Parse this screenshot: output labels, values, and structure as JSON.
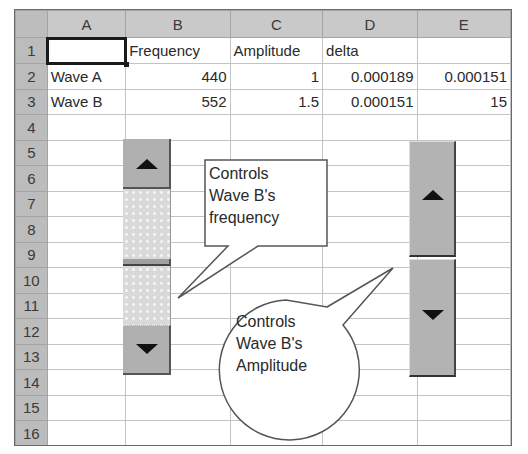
{
  "spreadsheet": {
    "columns": [
      "A",
      "B",
      "C",
      "D",
      "E"
    ],
    "rows": [
      {
        "n": "1",
        "cells": [
          "",
          "Frequency",
          "Amplitude",
          "delta",
          ""
        ]
      },
      {
        "n": "2",
        "cells": [
          "Wave A",
          "440",
          "1",
          "0.000189",
          "0.000151"
        ]
      },
      {
        "n": "3",
        "cells": [
          "Wave B",
          "552",
          "1.5",
          "0.000151",
          "15"
        ]
      },
      {
        "n": "4",
        "cells": [
          "",
          "",
          "",
          "",
          ""
        ]
      },
      {
        "n": "5",
        "cells": [
          "",
          "",
          "",
          "",
          ""
        ]
      },
      {
        "n": "6",
        "cells": [
          "",
          "",
          "",
          "",
          ""
        ]
      },
      {
        "n": "7",
        "cells": [
          "",
          "",
          "",
          "",
          ""
        ]
      },
      {
        "n": "8",
        "cells": [
          "",
          "",
          "",
          "",
          ""
        ]
      },
      {
        "n": "9",
        "cells": [
          "",
          "",
          "",
          "",
          ""
        ]
      },
      {
        "n": "10",
        "cells": [
          "",
          "",
          "",
          "",
          ""
        ]
      },
      {
        "n": "11",
        "cells": [
          "",
          "",
          "",
          "",
          ""
        ]
      },
      {
        "n": "12",
        "cells": [
          "",
          "",
          "",
          "",
          ""
        ]
      },
      {
        "n": "13",
        "cells": [
          "",
          "",
          "",
          "",
          ""
        ]
      },
      {
        "n": "14",
        "cells": [
          "",
          "",
          "",
          "",
          ""
        ]
      },
      {
        "n": "15",
        "cells": [
          "",
          "",
          "",
          "",
          ""
        ]
      },
      {
        "n": "16",
        "cells": [
          "",
          "",
          "",
          "",
          ""
        ]
      }
    ],
    "selected_cell": "A1"
  },
  "controls": {
    "scrollbar": {
      "name": "Wave B frequency scrollbar",
      "up_icon": "triangle-up",
      "down_icon": "triangle-down"
    },
    "spinner": {
      "name": "Wave B amplitude spinner",
      "up_icon": "triangle-up",
      "down_icon": "triangle-down"
    }
  },
  "callouts": {
    "frequency": {
      "line1": "Controls",
      "line2": "Wave B's",
      "line3": "frequency"
    },
    "amplitude": {
      "line1": "Controls",
      "line2": "Wave B's",
      "line3": "Amplitude"
    }
  },
  "colors": {
    "header_bg": "#c9c9c9",
    "control_gray": "#b0b0b0",
    "grid_line": "#c4c4c4"
  }
}
